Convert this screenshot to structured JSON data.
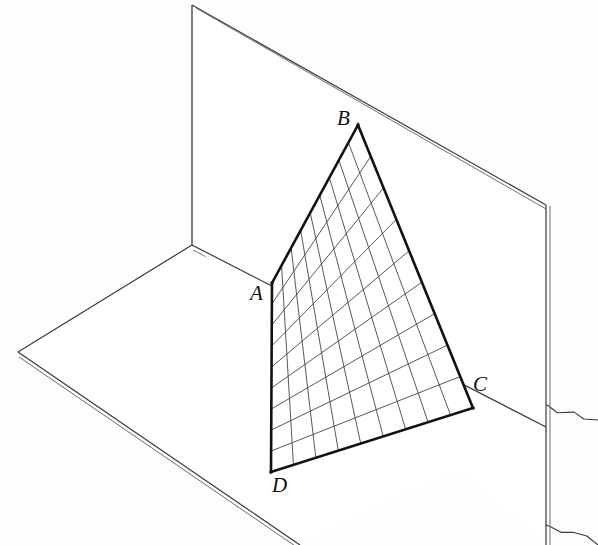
{
  "figure": {
    "kind": "ruled-surface-diagram",
    "background_color": "#fdfdfc",
    "ink_color": "#1a1a1a",
    "grid_color": "#444444",
    "plane_edge_color": "#333333"
  },
  "vertices": [
    {
      "label": "A",
      "x": 272,
      "y": 283,
      "label_x": 250,
      "label_y": 283
    },
    {
      "label": "B",
      "x": 358,
      "y": 125,
      "label_x": 337,
      "label_y": 108
    },
    {
      "label": "C",
      "x": 473,
      "y": 408,
      "label_x": 473,
      "label_y": 374
    },
    {
      "label": "D",
      "x": 271,
      "y": 472,
      "label_x": 272,
      "label_y": 475
    }
  ],
  "patch": {
    "name": "quadrilateral-ABCD",
    "corner_order": [
      "A",
      "B",
      "C",
      "D"
    ],
    "u_divisions": 9,
    "v_divisions": 9,
    "outline_width": 2.6,
    "grid_width": 0.9
  },
  "planes": {
    "vertical": {
      "name": "vertical-plane",
      "outline": [
        [
          192,
          5
        ],
        [
          546,
          205
        ],
        [
          546,
          545
        ],
        [
          192,
          245
        ]
      ],
      "top_edge": [
        [
          192,
          5
        ],
        [
          546,
          205
        ]
      ],
      "left_edge": [
        [
          192,
          5
        ],
        [
          192,
          245
        ]
      ],
      "right_edge": [
        [
          546,
          205
        ],
        [
          546,
          545
        ]
      ]
    },
    "horizontal": {
      "name": "horizontal-plane",
      "outline": [
        [
          192,
          245
        ],
        [
          546,
          427
        ],
        [
          300,
          545
        ],
        [
          18,
          352
        ]
      ],
      "left_front_edge": [
        [
          18,
          352
        ],
        [
          300,
          545
        ]
      ],
      "left_back_edge": [
        [
          18,
          352
        ],
        [
          192,
          245
        ]
      ],
      "right_back_edge": [
        [
          192,
          245
        ],
        [
          546,
          427
        ]
      ]
    },
    "intersection_line": [
      [
        192,
        245
      ],
      [
        546,
        427
      ]
    ]
  },
  "chart_data": {
    "type": "scatter",
    "title": "",
    "xlabel": "",
    "ylabel": "",
    "categories": [
      "A",
      "B",
      "C",
      "D"
    ],
    "x": [
      272,
      358,
      473,
      271
    ],
    "y": [
      283,
      125,
      408,
      472
    ],
    "series": [
      {
        "name": "quadrilateral-corners",
        "values": [
          283,
          125,
          408,
          472
        ]
      }
    ],
    "grid": true,
    "legend": "none"
  }
}
